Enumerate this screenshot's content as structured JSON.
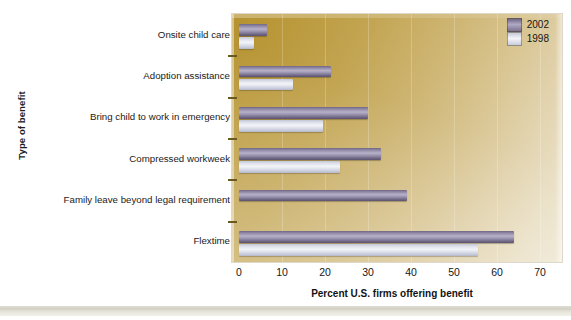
{
  "chart_data": {
    "type": "bar",
    "orientation": "horizontal",
    "title": "",
    "xlabel": "Percent U.S. firms offering benefit",
    "ylabel": "Type of benefit",
    "categories": [
      "Onsite child care",
      "Adoption assistance",
      "Bring child to work in emergency",
      "Compressed workweek",
      "Family leave beyond legal requirement",
      "Flextime"
    ],
    "series": [
      {
        "name": "2002",
        "color": "#7a7290",
        "values": [
          6.5,
          21.5,
          30,
          33,
          39,
          64
        ]
      },
      {
        "name": "1998",
        "color": "#dfe2ea",
        "values": [
          3.5,
          12.5,
          19.5,
          23.5,
          null,
          55.5
        ]
      }
    ],
    "xlim": [
      0,
      70
    ],
    "xticks": [
      0,
      10,
      20,
      30,
      40,
      50,
      60,
      70
    ],
    "xticklabels": [
      "0",
      "10",
      "20",
      "30",
      "40",
      "50",
      "60",
      "70"
    ],
    "grid": true,
    "legend_position": "top-right",
    "legend_entries": [
      "2002",
      "1998"
    ],
    "plot_background": "#c9ad5c"
  }
}
